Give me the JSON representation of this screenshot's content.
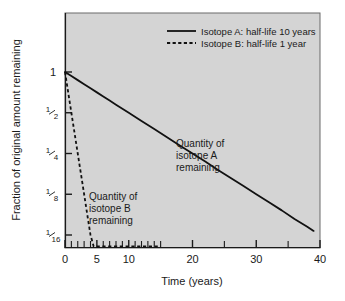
{
  "chart_data": {
    "type": "line",
    "title": "",
    "xlabel": "Time (years)",
    "ylabel": "Fraction of original amount remaining",
    "xlim": [
      0,
      40
    ],
    "ylim": [
      0.0625,
      1
    ],
    "yscale": "log2",
    "grid": false,
    "legend_position": "top-center",
    "xticks": [
      0,
      5,
      10,
      20,
      30,
      40
    ],
    "xticklabels": [
      "0",
      "5",
      "10",
      "20",
      "30",
      "40"
    ],
    "xminorticks": [
      1,
      2,
      3,
      4,
      6,
      7,
      8,
      9,
      11,
      12,
      13,
      14,
      15,
      25,
      35
    ],
    "yticks": [
      1,
      0.5,
      0.25,
      0.125,
      0.0625
    ],
    "yticklabels": [
      "1",
      "1/2",
      "1/4",
      "1/8",
      "1/16"
    ],
    "ytick_fractions": [
      {
        "whole": "1",
        "num": "",
        "den": ""
      },
      {
        "whole": "",
        "num": "1",
        "den": "2"
      },
      {
        "whole": "",
        "num": "1",
        "den": "4"
      },
      {
        "whole": "",
        "num": "1",
        "den": "8"
      },
      {
        "whole": "",
        "num": "1",
        "den": "16"
      }
    ],
    "series": [
      {
        "name": "Isotope A: half-life 10 years",
        "half_life": 10,
        "style": "solid",
        "color": "#111111",
        "x": [
          0,
          1,
          2,
          3,
          4,
          5,
          6,
          7,
          8,
          9,
          10,
          12,
          14,
          16,
          18,
          20,
          22,
          24,
          26,
          28,
          30,
          32,
          34,
          36,
          38,
          39
        ],
        "y": [
          1,
          0.933,
          0.871,
          0.812,
          0.758,
          0.707,
          0.66,
          0.616,
          0.574,
          0.536,
          0.5,
          0.435,
          0.379,
          0.33,
          0.287,
          0.25,
          0.218,
          0.189,
          0.165,
          0.144,
          0.125,
          0.109,
          0.095,
          0.082,
          0.072,
          0.067
        ]
      },
      {
        "name": "Isotope B: half-life 1 year",
        "half_life": 1,
        "style": "dashed",
        "color": "#111111",
        "x": [
          0,
          0.25,
          0.5,
          0.75,
          1,
          1.25,
          1.5,
          1.75,
          2,
          2.25,
          2.5,
          2.75,
          3,
          3.25,
          3.5,
          3.75,
          4,
          4.5,
          5,
          6,
          8,
          10,
          12,
          14,
          15
        ],
        "y": [
          1,
          0.841,
          0.707,
          0.595,
          0.5,
          0.42,
          0.354,
          0.297,
          0.25,
          0.21,
          0.177,
          0.149,
          0.125,
          0.105,
          0.088,
          0.074,
          0.0625,
          0.044,
          0.031,
          0.0156,
          0.0039,
          0.00098,
          0.00024,
          6e-05,
          3e-05
        ]
      }
    ],
    "annotations": [
      {
        "name": "isotope-a-region-label",
        "lines": [
          "Quantity of",
          "isotope A",
          "remaining"
        ],
        "x": 17.5,
        "y_px": 143
      },
      {
        "name": "isotope-b-region-label",
        "lines": [
          "Quantity of",
          "isotope B",
          "remaining"
        ],
        "x": 5.0,
        "y_px": 196
      }
    ],
    "legend": [
      {
        "label": "Isotope A: half-life 10 years",
        "style": "solid"
      },
      {
        "label": "Isotope B: half-life 1 year",
        "style": "dashed"
      }
    ]
  },
  "style": {
    "plot_background": "#d4d4d4",
    "page_background": "#ffffff",
    "axis_color": "#1a1a1a",
    "line_color": "#111111"
  }
}
